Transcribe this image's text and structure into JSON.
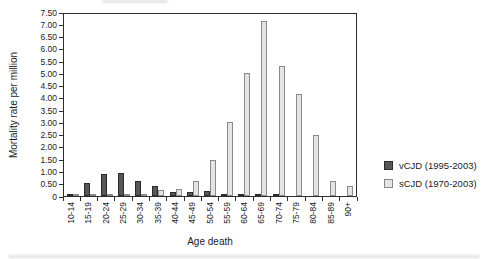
{
  "chart_data": {
    "type": "bar",
    "title": "",
    "xlabel": "Age death",
    "ylabel": "Mortality rate per million",
    "categories": [
      "10-14",
      "15-19",
      "20-24",
      "25-29",
      "30-34",
      "35-39",
      "40-44",
      "45-49",
      "50-54",
      "55-59",
      "60-64",
      "65-69",
      "70-74",
      "75-79",
      "80-84",
      "85-89",
      "90+"
    ],
    "series": [
      {
        "name": "vCJD (1995-2003)",
        "color": "#575757",
        "border_color": "#2b2b2b",
        "values": [
          0.05,
          0.55,
          0.9,
          0.95,
          0.6,
          0.4,
          0.15,
          0.15,
          0.2,
          0.05,
          0.08,
          0.08,
          0.1,
          0,
          0,
          0,
          0
        ]
      },
      {
        "name": "sCJD (1970-2003)",
        "color": "#e4e4e4",
        "border_color": "#8a8a8a",
        "values": [
          0.02,
          0.02,
          0.03,
          0.05,
          0.05,
          0.25,
          0.3,
          0.6,
          1.45,
          3.0,
          5.0,
          7.15,
          5.3,
          4.15,
          2.5,
          0.6,
          0.4
        ]
      }
    ],
    "ylim": [
      0,
      7.5
    ],
    "y_tick_step": 0.5,
    "y_tick_labels": [
      "0",
      "0.50",
      "1.00",
      "1.50",
      "2.00",
      "2.50",
      "3.00",
      "3.50",
      "4.00",
      "4.50",
      "5.00",
      "5.50",
      "6.00",
      "6.50",
      "7.00",
      "7.50"
    ],
    "grid": false,
    "legend_position": "right"
  },
  "colors": {
    "axis": "#2e2e2e",
    "background": "#ffffff"
  }
}
